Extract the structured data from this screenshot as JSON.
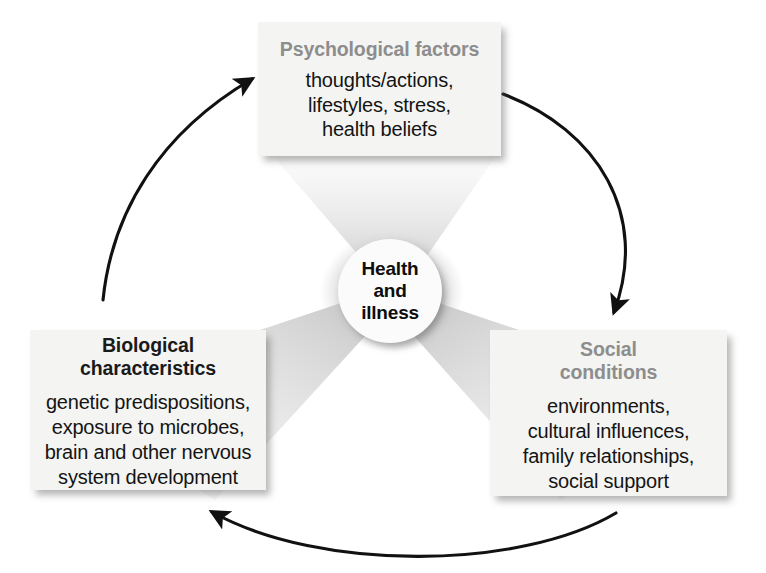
{
  "diagram": {
    "title_text": "Health and illness biopsychosocial model",
    "center": {
      "label": "Health\nand\nillness"
    },
    "nodes": [
      {
        "id": "psychological",
        "title": "Psychological factors",
        "title_color": "#8d8d8d",
        "body": "thoughts/actions,\nlifestyles, stress,\nhealth beliefs"
      },
      {
        "id": "biological",
        "title": "Biological\ncharacteristics",
        "title_color": "#1a1a1a",
        "body": "genetic predispositions,\nexposure to microbes,\nbrain and other nervous\nsystem development"
      },
      {
        "id": "social",
        "title": "Social\nconditions",
        "title_color": "#8d8d8d",
        "body": "environments,\ncultural influences,\nfamily relationships,\nsocial support"
      }
    ],
    "arrows": [
      {
        "id": "biological-to-psychological",
        "from": "biological",
        "to": "psychological",
        "direction": "counterclockwise"
      },
      {
        "id": "psychological-to-social",
        "from": "psychological",
        "to": "social",
        "direction": "counterclockwise"
      },
      {
        "id": "social-to-biological",
        "from": "social",
        "to": "biological",
        "direction": "counterclockwise"
      }
    ],
    "colors": {
      "background": "#ffffff",
      "box_fill": "#f4f4f3",
      "wedge_gray": "#cccccc",
      "arrow_stroke": "#111111",
      "title_gray": "#8d8d8d",
      "title_dark": "#1a1a1a"
    }
  }
}
